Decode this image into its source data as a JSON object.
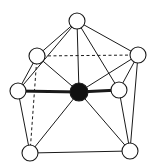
{
  "diagram": {
    "type": "molecular-geometry",
    "colors": {
      "line": "#1a1a1a",
      "central_atom": "#111111",
      "ligand_fill": "#ffffff"
    },
    "nodes": [
      {
        "id": "top",
        "x": 77,
        "y": 21,
        "r": 8,
        "kind": "ligand"
      },
      {
        "id": "upper-left",
        "x": 37,
        "y": 56,
        "r": 8,
        "kind": "ligand"
      },
      {
        "id": "upper-right",
        "x": 138,
        "y": 55,
        "r": 8,
        "kind": "ligand"
      },
      {
        "id": "left",
        "x": 18,
        "y": 91,
        "r": 8,
        "kind": "ligand"
      },
      {
        "id": "center",
        "x": 79,
        "y": 92,
        "r": 9,
        "kind": "central"
      },
      {
        "id": "right",
        "x": 119,
        "y": 90,
        "r": 8,
        "kind": "ligand"
      },
      {
        "id": "bottom-left",
        "x": 30,
        "y": 153,
        "r": 8,
        "kind": "ligand"
      },
      {
        "id": "bottom-right",
        "x": 130,
        "y": 151,
        "r": 8,
        "kind": "ligand"
      }
    ],
    "edges": [
      {
        "from": "top",
        "to": "upper-left",
        "style": "solid"
      },
      {
        "from": "top",
        "to": "left",
        "style": "solid"
      },
      {
        "from": "top",
        "to": "center",
        "style": "solid"
      },
      {
        "from": "top",
        "to": "right",
        "style": "solid"
      },
      {
        "from": "top",
        "to": "upper-right",
        "style": "solid"
      },
      {
        "from": "upper-left",
        "to": "upper-right",
        "style": "dashed"
      },
      {
        "from": "upper-left",
        "to": "left",
        "style": "solid"
      },
      {
        "from": "upper-left",
        "to": "center",
        "style": "solid"
      },
      {
        "from": "upper-left",
        "to": "bottom-left",
        "style": "dashed"
      },
      {
        "from": "upper-right",
        "to": "center",
        "style": "solid"
      },
      {
        "from": "upper-right",
        "to": "right",
        "style": "solid"
      },
      {
        "from": "upper-right",
        "to": "bottom-right",
        "style": "solid"
      },
      {
        "from": "left",
        "to": "center",
        "style": "thick"
      },
      {
        "from": "center",
        "to": "right",
        "style": "thick"
      },
      {
        "from": "left",
        "to": "bottom-left",
        "style": "solid"
      },
      {
        "from": "center",
        "to": "bottom-left",
        "style": "solid"
      },
      {
        "from": "center",
        "to": "bottom-right",
        "style": "solid"
      },
      {
        "from": "right",
        "to": "bottom-right",
        "style": "solid"
      },
      {
        "from": "bottom-left",
        "to": "bottom-right",
        "style": "solid"
      }
    ]
  }
}
